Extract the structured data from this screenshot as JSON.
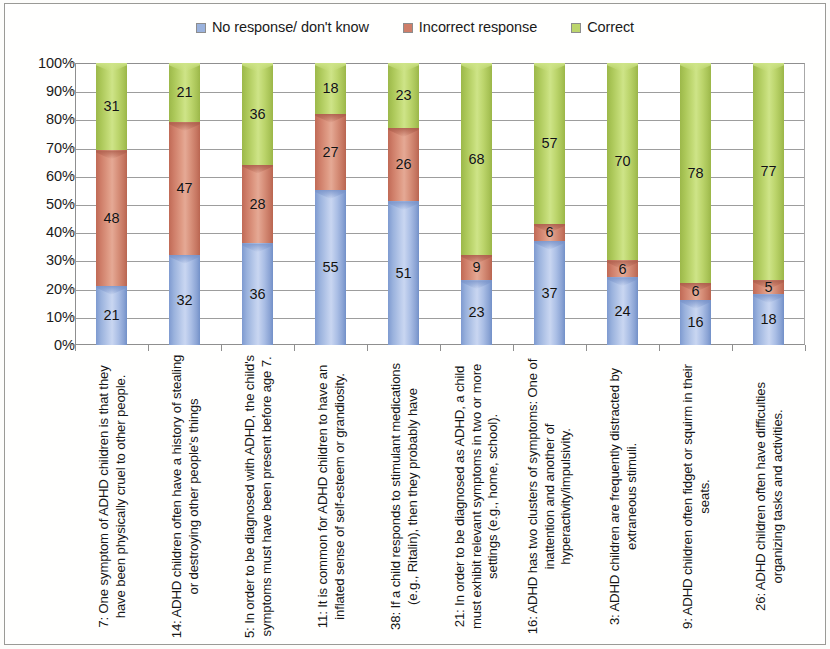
{
  "legend": {
    "position": "top-center",
    "entries": [
      {
        "label": "No response/ don't know",
        "color": "#9ab2dd",
        "icon": "legend-swatch-blue"
      },
      {
        "label": "Incorrect response",
        "color": "#cf7e69",
        "icon": "legend-swatch-red"
      },
      {
        "label": "Correct",
        "color": "#bcd56c",
        "icon": "legend-swatch-green"
      }
    ]
  },
  "yaxis": {
    "ticks": [
      "100%",
      "90%",
      "80%",
      "70%",
      "60%",
      "50%",
      "40%",
      "30%",
      "20%",
      "10%",
      "0%"
    ]
  },
  "chart_data": {
    "type": "bar",
    "subtype": "stacked-100-percent-cylinder",
    "title": "",
    "xlabel": "",
    "ylabel": "",
    "ylim": [
      0,
      100
    ],
    "ytick_labels": [
      "0%",
      "10%",
      "20%",
      "30%",
      "40%",
      "50%",
      "60%",
      "70%",
      "80%",
      "90%",
      "100%"
    ],
    "grid": true,
    "legend_position": "top-center",
    "categories": [
      "7: One symptom of ADHD children is that they have been physically cruel to other people.",
      "14: ADHD children often have a history of stealing or destroying other people's things",
      "5: In order to be diagnosed with ADHD, the child's symptoms must have been present before age 7.",
      "11: It is common for ADHD children to have an inflated sense of self-esteem or grandiosity.",
      "38: If a child responds to stimulant medications (e.g., Ritalin), then they probably have",
      "21: In order to be diagnosed as ADHD, a child must exhibit relevant symptoms in two or more settings (e.g., home, school).",
      "16: ADHD has two clusters of symptoms: One of inattention and another of hyperactivity/impulsivity.",
      "3: ADHD children are frequently distracted by extraneous stimuli.",
      "9: ADHD children often fidget or squirm in their seats.",
      "26: ADHD children often have difficulties organizing tasks and activities."
    ],
    "series": [
      {
        "name": "No response/ don't know",
        "color": "#9ab2dd",
        "values": [
          21,
          32,
          36,
          55,
          51,
          23,
          37,
          24,
          16,
          18
        ]
      },
      {
        "name": "Incorrect response",
        "color": "#cf7e69",
        "values": [
          48,
          47,
          28,
          27,
          26,
          9,
          6,
          6,
          6,
          5
        ]
      },
      {
        "name": "Correct",
        "color": "#bcd56c",
        "values": [
          31,
          21,
          36,
          18,
          23,
          68,
          57,
          70,
          78,
          77
        ]
      }
    ]
  }
}
